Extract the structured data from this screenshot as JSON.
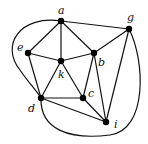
{
  "graph": {
    "nodes": [
      {
        "id": "a",
        "label": "a",
        "x": 61,
        "y": 21,
        "lx": 58,
        "ly": 14
      },
      {
        "id": "g",
        "label": "g",
        "x": 129,
        "y": 29,
        "lx": 127,
        "ly": 21
      },
      {
        "id": "e",
        "label": "e",
        "x": 28,
        "y": 53,
        "lx": 17,
        "ly": 51
      },
      {
        "id": "b",
        "label": "b",
        "x": 94,
        "y": 53,
        "lx": 98,
        "ly": 66
      },
      {
        "id": "k",
        "label": "k",
        "x": 61,
        "y": 61,
        "lx": 58,
        "ly": 78
      },
      {
        "id": "c",
        "label": "c",
        "x": 83,
        "y": 98,
        "lx": 88,
        "ly": 97
      },
      {
        "id": "d",
        "label": "d",
        "x": 41,
        "y": 98,
        "lx": 28,
        "ly": 112
      },
      {
        "id": "i",
        "label": "i",
        "x": 106,
        "y": 122,
        "lx": 114,
        "ly": 128
      }
    ],
    "edges": [
      [
        "a",
        "e"
      ],
      [
        "a",
        "k"
      ],
      [
        "a",
        "b"
      ],
      [
        "a",
        "g"
      ],
      [
        "e",
        "k"
      ],
      [
        "e",
        "d"
      ],
      [
        "k",
        "b"
      ],
      [
        "k",
        "d"
      ],
      [
        "k",
        "c"
      ],
      [
        "b",
        "g"
      ],
      [
        "b",
        "c"
      ],
      [
        "b",
        "i"
      ],
      [
        "g",
        "i"
      ],
      [
        "d",
        "c"
      ],
      [
        "d",
        "i"
      ],
      [
        "c",
        "i"
      ]
    ],
    "curved_edges": [
      {
        "from": "a",
        "to": "d",
        "path": "M61 21 C 20 15, 0 45, 20 70 C 28 82, 36 90, 41 98"
      },
      {
        "from": "g",
        "to": "d",
        "path": "M129 29 C 145 60, 148 130, 110 135 C 70 140, 40 130, 41 98"
      }
    ]
  }
}
